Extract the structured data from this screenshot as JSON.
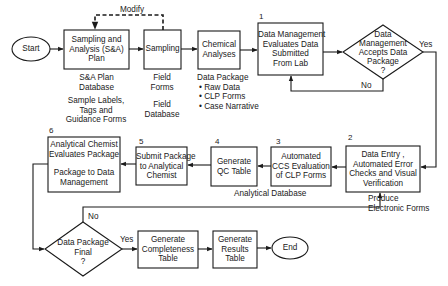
{
  "nodes": {
    "start": "Start",
    "sa_plan": [
      "Sampling and",
      "Analysis (S&A)",
      "Plan"
    ],
    "sampling": "Sampling",
    "chemical": [
      "Chemical",
      "Analyses"
    ],
    "box1": {
      "num": "1",
      "lines": [
        "Data Management",
        "Evaluates Data",
        "Submitted",
        "From Lab"
      ]
    },
    "decision1": [
      "Data",
      "Management",
      "Accepts Data",
      "Package",
      "?"
    ],
    "box2": {
      "num": "2",
      "lines": [
        "Data Entry ,",
        "Automated Error",
        "Checks and Visual",
        "Verification"
      ]
    },
    "box3": {
      "num": "3",
      "lines": [
        "Automated",
        "CCS Evaluation",
        "of CLP Forms"
      ]
    },
    "box4": {
      "num": "4",
      "lines": [
        "Generate",
        "QC Table"
      ]
    },
    "box5": {
      "num": "5",
      "lines": [
        "Submit Package",
        "to Analytical",
        "Chemist"
      ]
    },
    "box6": {
      "num": "6",
      "lines": [
        "Analytical Chemist",
        "Evaluates Package",
        "",
        "Package to Data",
        "Management"
      ]
    },
    "decision2": [
      "Data Package",
      "Final",
      "?"
    ],
    "completeness": [
      "Generate",
      "Completeness",
      "Table"
    ],
    "results": [
      "Generate",
      "Results",
      "Table"
    ],
    "end": "End"
  },
  "annotations": {
    "modify": "Modify",
    "sa_db": [
      "S&A Plan",
      "Database"
    ],
    "sample_labels": [
      "Sample Labels,",
      "Tags and",
      "Guidance Forms"
    ],
    "field_forms": [
      "Field",
      "Forms"
    ],
    "field_db": [
      "Field",
      "Database"
    ],
    "data_package": "Data Package",
    "data_package_items": [
      "• Raw Data",
      "• CLP Forms",
      "• Case Narrative"
    ],
    "analytical_db": "Analytical Database",
    "produce_forms": [
      "Produce",
      "Electronic Forms"
    ],
    "yes1": "Yes",
    "no1": "No",
    "yes2": "Yes",
    "no2": "No"
  }
}
